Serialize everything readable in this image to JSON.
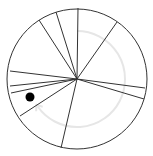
{
  "board": {
    "center": [
      77,
      79
    ],
    "radius": 70,
    "stroke_color": "#333333",
    "background": "#ffffff"
  },
  "spokes": [
    [
      78,
      8
    ],
    [
      117,
      22
    ],
    [
      145,
      88
    ],
    [
      144,
      99
    ],
    [
      61,
      148
    ],
    [
      20,
      116
    ],
    [
      11,
      93
    ],
    [
      10,
      86
    ],
    [
      10,
      71
    ],
    [
      39,
      20
    ],
    [
      56,
      12
    ]
  ],
  "path_arc": {
    "radius": 48,
    "color": "#e6e6e6",
    "start_deg": -90,
    "end_deg": 145
  },
  "ball": {
    "cx": 30,
    "cy": 97,
    "r": 4.5,
    "color": "#000000"
  }
}
